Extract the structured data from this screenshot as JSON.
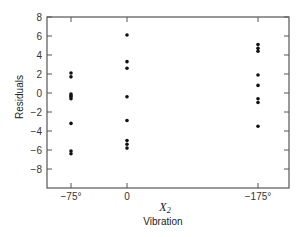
{
  "chart_data": {
    "type": "scatter",
    "title": "",
    "xlabel": "X2",
    "xlabel_symbol": "X",
    "xlabel_subscript": "2",
    "xlabel_sub": "Vibration",
    "ylabel": "Residuals",
    "ylim": [
      -10,
      8
    ],
    "yticks": [
      8,
      6,
      4,
      2,
      0,
      -2,
      -4,
      -6,
      -8
    ],
    "ytick_labels": [
      "8",
      "6",
      "4",
      "2",
      "0",
      "−2",
      "−4",
      "−6",
      "−8"
    ],
    "categories": [
      "−75°",
      "0",
      "−175°"
    ],
    "grid": false,
    "legend": null,
    "series": [
      {
        "name": "Residuals by vibration level",
        "points": [
          {
            "x": "−75°",
            "y": 2.1
          },
          {
            "x": "−75°",
            "y": 1.7
          },
          {
            "x": "−75°",
            "y": -0.1
          },
          {
            "x": "−75°",
            "y": -0.3
          },
          {
            "x": "−75°",
            "y": -0.4
          },
          {
            "x": "−75°",
            "y": -0.6
          },
          {
            "x": "−75°",
            "y": -3.2
          },
          {
            "x": "−75°",
            "y": -6.1
          },
          {
            "x": "−75°",
            "y": -6.4
          },
          {
            "x": "0",
            "y": 6.1
          },
          {
            "x": "0",
            "y": 3.3
          },
          {
            "x": "0",
            "y": 2.6
          },
          {
            "x": "0",
            "y": -0.4
          },
          {
            "x": "0",
            "y": -2.9
          },
          {
            "x": "0",
            "y": -5.0
          },
          {
            "x": "0",
            "y": -5.4
          },
          {
            "x": "0",
            "y": -5.8
          },
          {
            "x": "−175°",
            "y": 5.1
          },
          {
            "x": "−175°",
            "y": 4.7
          },
          {
            "x": "−175°",
            "y": 4.4
          },
          {
            "x": "−175°",
            "y": 1.9
          },
          {
            "x": "−175°",
            "y": 0.8
          },
          {
            "x": "−175°",
            "y": -0.6
          },
          {
            "x": "−175°",
            "y": -1.0
          },
          {
            "x": "−175°",
            "y": -3.5
          }
        ]
      }
    ]
  },
  "colors": {
    "axis": "#555555",
    "point": "#111111",
    "text": "#333333"
  }
}
